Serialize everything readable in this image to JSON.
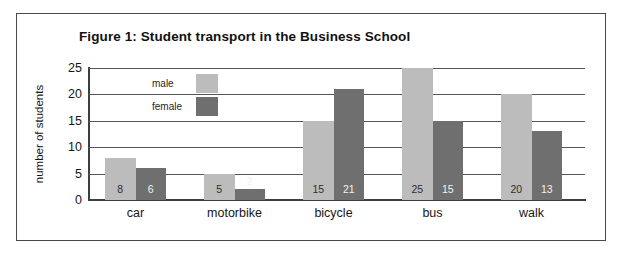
{
  "figure": {
    "title": "Figure 1: Student transport in the Business School",
    "frame_border_color": "#4a4a4a"
  },
  "legend": {
    "position": "inside-top-left",
    "entries": [
      {
        "label": "male",
        "color": "#bcbcbc"
      },
      {
        "label": "female",
        "color": "#6f6f6f"
      }
    ]
  },
  "axes": {
    "y_title": "number of students",
    "y_ticks": [
      "0",
      "5",
      "10",
      "15",
      "20",
      "25"
    ],
    "x_labels": [
      "car",
      "motorbike",
      "bicycle",
      "bus",
      "walk"
    ]
  },
  "chart_data": {
    "type": "bar",
    "title": "Figure 1: Student transport in the Business School",
    "xlabel": "",
    "ylabel": "number of students",
    "categories": [
      "car",
      "motorbike",
      "bicycle",
      "bus",
      "walk"
    ],
    "series": [
      {
        "name": "male",
        "color": "#bcbcbc",
        "values": [
          8,
          5,
          15,
          25,
          20
        ]
      },
      {
        "name": "female",
        "color": "#6f6f6f",
        "values": [
          6,
          2,
          21,
          15,
          13
        ]
      }
    ],
    "ylim": [
      0,
      25
    ],
    "ytick_step": 5,
    "yticks": [
      0,
      5,
      10,
      15,
      20,
      25
    ],
    "grid": "horizontal",
    "data_labels": true,
    "legend_position": "inside-top-left"
  }
}
